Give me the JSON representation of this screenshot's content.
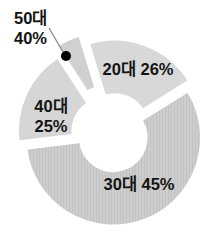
{
  "chart_data": {
    "type": "pie",
    "variant": "exploded-donut",
    "unit": "%",
    "title": "",
    "legend": "none (labels placed on/next to slices)",
    "slices": [
      {
        "label": "20대",
        "percent": 26,
        "pct_label": "26%",
        "display": "20대 26%",
        "color": "#d8d8d8",
        "textured": false,
        "start_angle": 107,
        "end_angle": 32,
        "explode": 7
      },
      {
        "label": "30대",
        "percent": 45,
        "pct_label": "45%",
        "display": "30대 45%",
        "color": "#cdcdcd",
        "textured": true,
        "start_angle": 32,
        "end_angle": -173,
        "explode": 4
      },
      {
        "label": "40대",
        "percent": 25,
        "pct_label": "25%",
        "display": "40대 25%",
        "color": "#d6d6d6",
        "textured": false,
        "start_angle": 187,
        "end_angle": 123,
        "explode": 7
      },
      {
        "label": "50대",
        "percent": 40,
        "pct_label": "40%",
        "display": "50대 40%",
        "color": "#d0d0d0",
        "textured": false,
        "start_angle": 123,
        "end_angle": 107,
        "explode": 16
      }
    ]
  },
  "colors": {
    "background": "#ffffff",
    "slice_gap": "#ffffff",
    "text": "#141414",
    "marker_dot": "#000000",
    "callout_line": "#8a8a8a",
    "texture_line": "#c3c3c3"
  }
}
